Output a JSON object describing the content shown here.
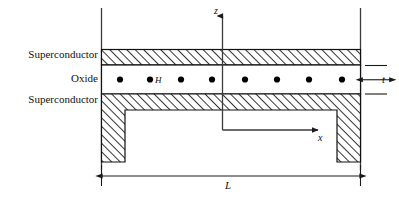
{
  "figure": {
    "title_caption": "",
    "layers": [
      {
        "id": "upper-superconductor",
        "label": "Superconductor",
        "fill": "hatched"
      },
      {
        "id": "oxide",
        "label": "Oxide",
        "fill": "white"
      },
      {
        "id": "lower-superconductor",
        "label": "Superconductor",
        "fill": "hatched"
      }
    ],
    "axes": {
      "vertical_label": "z",
      "horizontal_label": "x",
      "origin_label": ""
    },
    "dimensions": [
      {
        "id": "thickness",
        "label": "t",
        "position": "right",
        "orientation": "vertical"
      },
      {
        "id": "length",
        "label": "L",
        "position": "bottom",
        "orientation": "horizontal"
      }
    ],
    "field": {
      "label": "H",
      "symbol_name": "out-of-plane-field-dot",
      "count": 8
    },
    "colors": {
      "line": "#1a1a1a",
      "hatch": "#111111",
      "background": "#ffffff",
      "dot": "#000000"
    }
  }
}
